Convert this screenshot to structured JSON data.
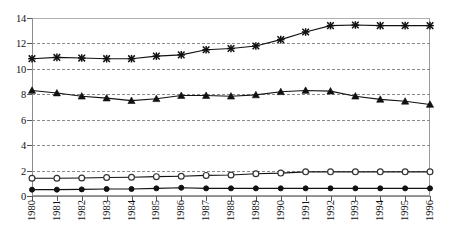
{
  "chart_data": {
    "type": "line",
    "title": "",
    "xlabel": "",
    "ylabel": "",
    "ylim": [
      0,
      14
    ],
    "yticks": [
      0,
      2,
      4,
      6,
      8,
      10,
      12,
      14
    ],
    "grid": true,
    "grid_style": "dashed-horizontal",
    "legend": "none",
    "categories": [
      "1980",
      "1981",
      "1982",
      "1983",
      "1984",
      "1985",
      "1986",
      "1987",
      "1988",
      "1989",
      "1990",
      "1991",
      "1992",
      "1993",
      "1994",
      "1995",
      "1996"
    ],
    "series": [
      {
        "name": "series-cross",
        "marker": "cross",
        "values": [
          10.8,
          10.9,
          10.85,
          10.8,
          10.8,
          11.0,
          11.1,
          11.5,
          11.6,
          11.8,
          12.3,
          12.9,
          13.4,
          13.45,
          13.4,
          13.4,
          13.4
        ]
      },
      {
        "name": "series-triangle",
        "marker": "triangle",
        "values": [
          8.3,
          8.1,
          7.85,
          7.7,
          7.5,
          7.65,
          7.9,
          7.9,
          7.85,
          7.95,
          8.2,
          8.3,
          8.25,
          7.85,
          7.6,
          7.45,
          7.2
        ]
      },
      {
        "name": "series-open-circle",
        "marker": "open-circle",
        "values": [
          1.4,
          1.4,
          1.42,
          1.45,
          1.47,
          1.52,
          1.55,
          1.62,
          1.65,
          1.75,
          1.8,
          1.9,
          1.9,
          1.9,
          1.9,
          1.9,
          1.9
        ]
      },
      {
        "name": "series-filled-circle",
        "marker": "filled-circle",
        "values": [
          0.5,
          0.5,
          0.52,
          0.55,
          0.55,
          0.6,
          0.65,
          0.6,
          0.6,
          0.6,
          0.6,
          0.6,
          0.6,
          0.6,
          0.6,
          0.6,
          0.6
        ]
      }
    ]
  },
  "colors": {
    "line": "#121212",
    "grid": "#8a8a8a",
    "axis": "#8d8d8d",
    "text": "#111111",
    "background": "#ffffff"
  }
}
